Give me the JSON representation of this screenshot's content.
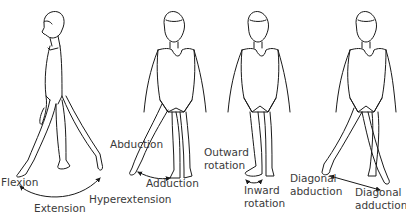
{
  "diagram": {
    "figures": [
      {
        "id": "side-view",
        "movements": [
          "Flexion",
          "Extension",
          "Hyperextension"
        ]
      },
      {
        "id": "front-abduction",
        "movements": [
          "Abduction",
          "Adduction"
        ]
      },
      {
        "id": "front-rotation",
        "movements": [
          "Outward rotation",
          "Inward rotation"
        ]
      },
      {
        "id": "front-diagonal",
        "movements": [
          "Diagonal abduction",
          "Diagonal adduction"
        ]
      }
    ],
    "labels": {
      "flexion": "Flexion",
      "extension": "Extension",
      "hyperextension": "Hyperextension",
      "abduction": "Abduction",
      "adduction": "Adduction",
      "outward_1": "Outward",
      "outward_2": "rotation",
      "inward_1": "Inward",
      "inward_2": "rotation",
      "diag_abd_1": "Diagonal",
      "diag_abd_2": "abduction",
      "diag_add_1": "Diagonal",
      "diag_add_2": "adduction"
    },
    "colors": {
      "line": "#1a1a1a",
      "text": "#3a3a3a",
      "background": "#ffffff"
    }
  }
}
